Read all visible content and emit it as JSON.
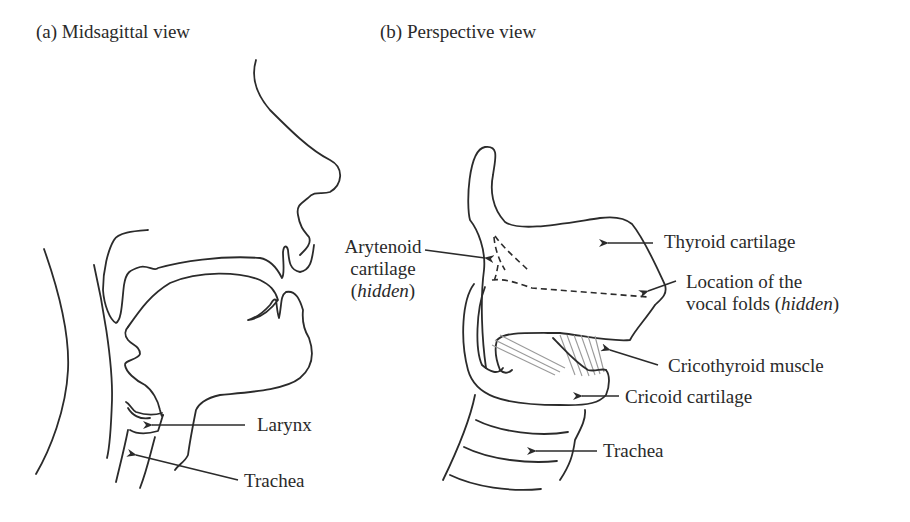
{
  "panels": {
    "a": {
      "title": "(a) Midsagittal view",
      "labels": {
        "larynx": "Larynx",
        "trachea": "Trachea"
      }
    },
    "b": {
      "title": "(b) Perspective view",
      "labels": {
        "arytenoid_line1": "Arytenoid",
        "arytenoid_line2": "cartilage",
        "arytenoid_hidden_open": "(",
        "arytenoid_hidden": "hidden",
        "arytenoid_hidden_close": ")",
        "thyroid": "Thyroid cartilage",
        "vocal_line1": "Location of the",
        "vocal_line2": "vocal folds (",
        "vocal_hidden": "hidden",
        "vocal_close": ")",
        "cricothyroid": "Cricothyroid muscle",
        "cricoid": "Cricoid cartilage",
        "trachea": "Trachea"
      }
    }
  },
  "colors": {
    "line": "#2b2b2b",
    "muscle_fibers": "#9a9a9a",
    "background": "#ffffff"
  }
}
